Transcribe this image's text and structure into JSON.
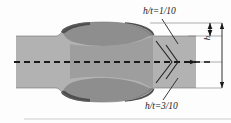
{
  "figure": {
    "kind": "engineering-cross-section-diagram",
    "background_color": "#fdfdfd"
  },
  "annotations": {
    "top_ratio_label": "h/t=1/10",
    "bottom_ratio_label": "h/t=3/10",
    "height_dimension_label": "h"
  },
  "colors": {
    "body_gray": "#b2b2b2",
    "zone_gray": "#8e8e8e",
    "dark_band": "#4f4f4f",
    "line_black": "#1a1a1a",
    "thin_gray_line": "#8a8a8a"
  },
  "geometry": {
    "centerline_style": "dashed",
    "symmetry_axis_y": 62,
    "shank_top_y": 36,
    "shank_bottom_y": 88,
    "bulge_top_y": 24,
    "bulge_bottom_y": 100,
    "bulge_left_x": 56,
    "bulge_right_x": 154,
    "right_edge_x": 196,
    "chevron_apex_x": 172
  }
}
